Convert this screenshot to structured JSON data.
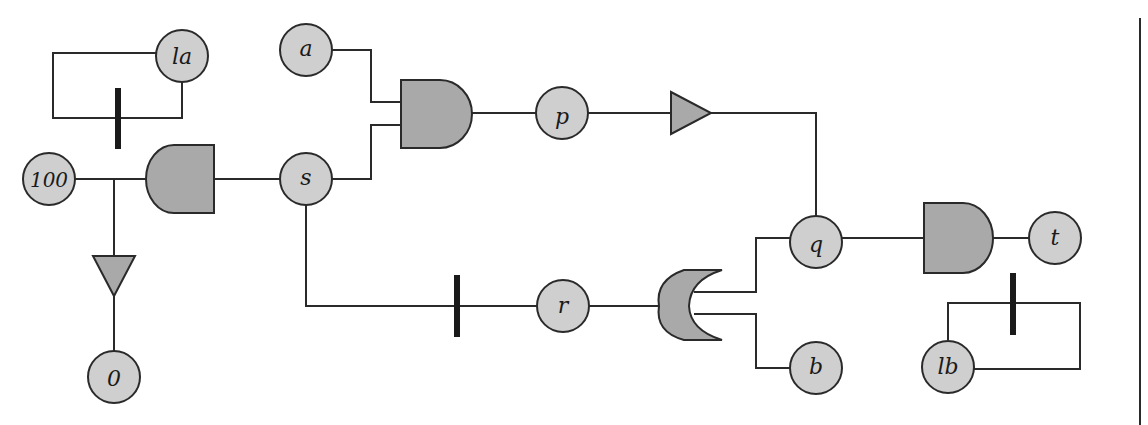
{
  "header": {
    "cropped_title_fragment": ""
  },
  "diagram": {
    "type": "gate-circuit",
    "nodes": [
      {
        "id": "la",
        "label": "la",
        "cx": 182,
        "cy": 56
      },
      {
        "id": "a",
        "label": "a",
        "cx": 306,
        "cy": 50
      },
      {
        "id": "100",
        "label": "100",
        "cx": 49,
        "cy": 179
      },
      {
        "id": "s",
        "label": "s",
        "cx": 306,
        "cy": 179
      },
      {
        "id": "p",
        "label": "p",
        "cx": 562,
        "cy": 113
      },
      {
        "id": "0",
        "label": "0",
        "cx": 114,
        "cy": 377
      },
      {
        "id": "r",
        "label": "r",
        "cx": 563,
        "cy": 306
      },
      {
        "id": "q",
        "label": "q",
        "cx": 816,
        "cy": 242
      },
      {
        "id": "b",
        "label": "b",
        "cx": 816,
        "cy": 366
      },
      {
        "id": "t",
        "label": "t",
        "cx": 1055,
        "cy": 242
      },
      {
        "id": "lb",
        "label": "lb",
        "cx": 948,
        "cy": 366
      }
    ],
    "gates": [
      {
        "id": "and-1",
        "kind": "and",
        "inputs": [
          "a",
          "s"
        ],
        "output": "p"
      },
      {
        "id": "and-reverse",
        "kind": "and-reversed",
        "inputs": [
          "s"
        ],
        "output": "100"
      },
      {
        "id": "buffer-right",
        "kind": "triangle-right",
        "input": "p",
        "output": "q"
      },
      {
        "id": "buffer-down",
        "kind": "triangle-down",
        "input": "100",
        "output": "0"
      },
      {
        "id": "or-split",
        "kind": "or-reversed",
        "input": "r",
        "outputs": [
          "q",
          "b"
        ]
      },
      {
        "id": "and-2",
        "kind": "and",
        "inputs": [
          "q"
        ],
        "output": "t"
      }
    ],
    "inhibitor_bars": [
      {
        "id": "bar-la",
        "on": "la-loop"
      },
      {
        "id": "bar-s-r",
        "on": "s-to-r"
      },
      {
        "id": "bar-lb",
        "on": "lb-loop"
      }
    ],
    "colors": {
      "node_fill": "#cfcfcf",
      "gate_fill": "#a9a9a9",
      "stroke": "#2a2a2a",
      "bar": "#1a1a1a"
    }
  }
}
